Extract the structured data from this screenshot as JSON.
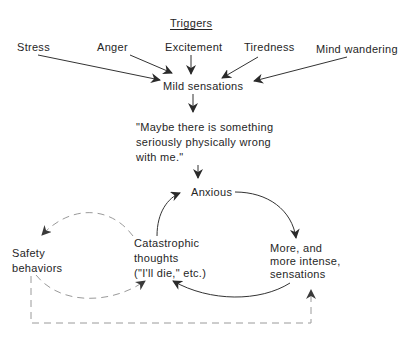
{
  "diagram": {
    "triggers_heading": "Triggers",
    "triggers": [
      "Stress",
      "Anger",
      "Excitement",
      "Tiredness",
      "Mind wandering"
    ],
    "nodes": {
      "mild_sensations": "Mild sensations",
      "belief": {
        "line1": "\"Maybe there is something",
        "line2": "seriously physically wrong",
        "line3": "with me.\""
      },
      "anxious": "Anxious",
      "catastrophic": {
        "line1": "Catastrophic",
        "line2": "thoughts",
        "line3": "(\"I'll die,\" etc.)"
      },
      "safety": {
        "line1": "Safety",
        "line2": "behaviors"
      },
      "more_sensations": {
        "line1": "More, and",
        "line2": "more intense,",
        "line3": "sensations"
      }
    },
    "edges": [
      {
        "from": "Stress",
        "to": "Mild sensations",
        "style": "solid"
      },
      {
        "from": "Anger",
        "to": "Mild sensations",
        "style": "solid"
      },
      {
        "from": "Excitement",
        "to": "Mild sensations",
        "style": "solid"
      },
      {
        "from": "Tiredness",
        "to": "Mild sensations",
        "style": "solid"
      },
      {
        "from": "Mind wandering",
        "to": "Mild sensations",
        "style": "solid"
      },
      {
        "from": "Mild sensations",
        "to": "Maybe there is something seriously physically wrong with me.",
        "style": "solid"
      },
      {
        "from": "Maybe there is something seriously physically wrong with me.",
        "to": "Anxious",
        "style": "solid"
      },
      {
        "from": "Anxious",
        "to": "More, and more intense, sensations",
        "style": "solid"
      },
      {
        "from": "More, and more intense, sensations",
        "to": "Catastrophic thoughts",
        "style": "solid"
      },
      {
        "from": "Catastrophic thoughts",
        "to": "Anxious",
        "style": "solid"
      },
      {
        "from": "Catastrophic thoughts",
        "to": "Safety behaviors",
        "style": "dashed"
      },
      {
        "from": "Safety behaviors",
        "to": "Catastrophic thoughts",
        "style": "dashed"
      },
      {
        "from": "Safety behaviors",
        "to": "More, and more intense, sensations",
        "style": "dashed"
      }
    ],
    "colors": {
      "ink": "#262626",
      "solid_line": "#333333",
      "dashed_line": "#9a9a9a",
      "background": "#ffffff"
    }
  }
}
